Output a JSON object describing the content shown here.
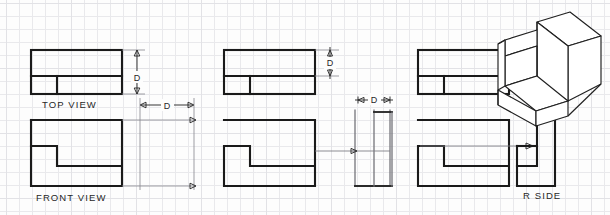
{
  "sheet": {
    "width": 610,
    "height": 215,
    "background_color": "#fdfdfd",
    "grid_color": "#e9e9ec",
    "line_color": "#1a1a1a",
    "grid_spacing": 13
  },
  "panels": [
    {
      "id": "panel-left",
      "name": "orthographic-projection-labeled",
      "labels": [
        {
          "name": "top-view-label",
          "text": "TOP VIEW",
          "x": 42,
          "y": 108
        },
        {
          "name": "front-view-label",
          "text": "FRONT VIEW",
          "x": 36,
          "y": 201
        }
      ],
      "dimensions": [
        {
          "name": "depth-dimension-vertical",
          "text": "D",
          "orientation": "vertical",
          "x": 137,
          "y": 77
        },
        {
          "name": "depth-dimension-horizontal",
          "text": "D",
          "orientation": "horizontal",
          "x": 167,
          "y": 105
        }
      ]
    },
    {
      "id": "panel-middle",
      "name": "orthographic-projection-depth-transfer",
      "labels": [],
      "dimensions": [
        {
          "name": "depth-dimension-vertical",
          "text": "D",
          "orientation": "vertical",
          "x": 330,
          "y": 66
        },
        {
          "name": "depth-dimension-horizontal",
          "text": "D",
          "orientation": "horizontal",
          "x": 374,
          "y": 100
        }
      ]
    },
    {
      "id": "panel-right",
      "name": "orthographic-projection-with-pictorial",
      "labels": [
        {
          "name": "right-side-view-label",
          "text": "R  SIDE",
          "x": 523,
          "y": 199
        }
      ],
      "dimensions": []
    }
  ],
  "views": [
    {
      "name": "top-view-left",
      "type": "top",
      "panel": "panel-left"
    },
    {
      "name": "front-view-left",
      "type": "front",
      "panel": "panel-left"
    },
    {
      "name": "top-view-middle",
      "type": "top",
      "panel": "panel-middle"
    },
    {
      "name": "front-view-middle",
      "type": "front",
      "panel": "panel-middle"
    },
    {
      "name": "right-side-view-middle",
      "type": "right-side",
      "panel": "panel-middle"
    },
    {
      "name": "top-view-right",
      "type": "top",
      "panel": "panel-right"
    },
    {
      "name": "front-view-right",
      "type": "front",
      "panel": "panel-right"
    },
    {
      "name": "right-side-view-right",
      "type": "right-side",
      "panel": "panel-right"
    },
    {
      "name": "isometric-pictorial-view",
      "type": "isometric",
      "panel": "panel-right"
    }
  ],
  "dimension_symbol": "D"
}
